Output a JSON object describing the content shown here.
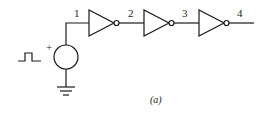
{
  "diagram": {
    "type": "inverter-chain-circuit",
    "caption": "(a)",
    "source": {
      "kind": "pulse-voltage-source",
      "polarity_label": "+",
      "waveform": "square-pulse"
    },
    "ground": {
      "kind": "ground-symbol"
    },
    "nodes": [
      {
        "id": "node-1",
        "label": "1"
      },
      {
        "id": "node-2",
        "label": "2"
      },
      {
        "id": "node-3",
        "label": "3"
      },
      {
        "id": "node-4",
        "label": "4"
      }
    ],
    "gates": [
      {
        "id": "inverter-1",
        "kind": "inverter",
        "input": "1",
        "output": "2"
      },
      {
        "id": "inverter-2",
        "kind": "inverter",
        "input": "2",
        "output": "3"
      },
      {
        "id": "inverter-3",
        "kind": "inverter",
        "input": "3",
        "output": "4"
      }
    ],
    "colors": {
      "stroke": "#1a1a1a",
      "background": "#ffffff"
    }
  }
}
